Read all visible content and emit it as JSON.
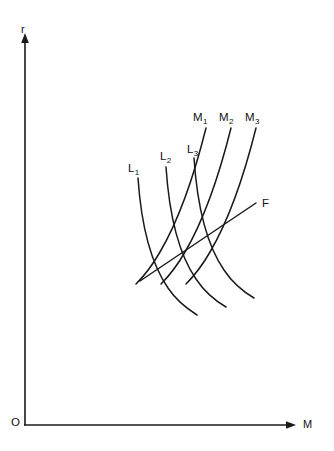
{
  "figure": {
    "type": "line-diagram",
    "background_color": "#ffffff",
    "line_color": "#1a1a1a"
  },
  "axes": {
    "y_axis_label": "r",
    "x_axis_label": "M",
    "origin_label": "O",
    "y_axis": {
      "x": 25,
      "top_y": 35,
      "bottom_y": 425
    },
    "x_axis": {
      "y": 425,
      "left_x": 25,
      "right_x": 295
    }
  },
  "curves": {
    "liquidity": [
      {
        "label": "L",
        "subscript": "1",
        "label_x": 128,
        "label_y": 163
      },
      {
        "label": "L",
        "subscript": "2",
        "label_x": 160,
        "label_y": 151
      },
      {
        "label": "L",
        "subscript": "3",
        "label_x": 187,
        "label_y": 144
      }
    ],
    "money": [
      {
        "label": "M",
        "subscript": "1",
        "label_x": 196,
        "label_y": 112
      },
      {
        "label": "M",
        "subscript": "2",
        "label_x": 222,
        "label_y": 112
      },
      {
        "label": "M",
        "subscript": "3",
        "label_x": 247,
        "label_y": 112
      }
    ],
    "f_curve": {
      "label": "F",
      "label_x": 262,
      "label_y": 201
    }
  },
  "chart_data": {
    "type": "line",
    "title": "",
    "xlabel": "M",
    "ylabel": "r",
    "grid": false,
    "legend": "inline-curve-labels",
    "series": [
      {
        "name": "L1",
        "kind": "liquidity-preference",
        "slope": "negative",
        "shape": "convex-to-origin",
        "path": "M 138,178 C 141,222 150,262 168,288 C 176,300 186,308 197,315"
      },
      {
        "name": "L2",
        "kind": "liquidity-preference",
        "slope": "negative",
        "shape": "convex-to-origin",
        "path": "M 166,167 C 169,212 178,253 196,279 C 204,291 214,300 226,307"
      },
      {
        "name": "L3",
        "kind": "liquidity-preference",
        "slope": "negative",
        "shape": "convex-to-origin",
        "path": "M 194,158 C 197,203 206,244 224,270 C 232,282 242,291 254,298"
      },
      {
        "name": "M1",
        "kind": "money-supply",
        "slope": "positive",
        "shape": "concave",
        "path": "M 206,128 C 196,168 180,218 160,252 C 152,266 144,276 136,284"
      },
      {
        "name": "M2",
        "kind": "money-supply",
        "slope": "positive",
        "shape": "concave",
        "path": "M 231,128 C 221,168 205,218 185,252 C 177,266 169,276 161,284"
      },
      {
        "name": "M3",
        "kind": "money-supply",
        "slope": "positive",
        "shape": "concave",
        "path": "M 256,128 C 246,168 230,218 210,252 C 202,266 194,276 186,284"
      },
      {
        "name": "F",
        "kind": "equilibrium-locus",
        "slope": "positive",
        "shape": "straight",
        "path": "M 140,281 L 256,203"
      }
    ],
    "intersections": [
      {
        "name": "E1",
        "curves": [
          "L1",
          "M1"
        ],
        "x": 172,
        "y": 262
      },
      {
        "name": "E2",
        "curves": [
          "L2",
          "M2"
        ],
        "x": 198,
        "y": 245
      },
      {
        "name": "E3",
        "curves": [
          "L3",
          "M3"
        ],
        "x": 225,
        "y": 228
      }
    ]
  }
}
